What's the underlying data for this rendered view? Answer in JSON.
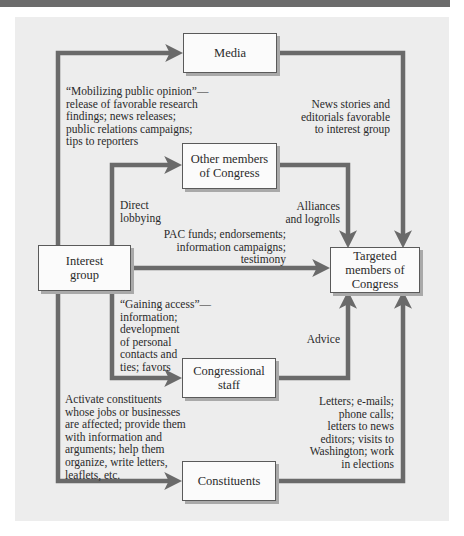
{
  "figure": {
    "banner_title": "",
    "nodes": {
      "media": "Media",
      "other_members": [
        "Other members",
        "of Congress"
      ],
      "interest_group": [
        "Interest",
        "group"
      ],
      "targeted": [
        "Targeted",
        "members of",
        "Congress"
      ],
      "staff": [
        "Congressional",
        "staff"
      ],
      "constituents": "Constituents"
    },
    "edges": {
      "mobilizing": [
        "“Mobilizing public opinion”—",
        "release of favorable research",
        "findings; news releases;",
        "public relations campaigns;",
        "tips to reporters"
      ],
      "news_stories": [
        "News stories and",
        "editorials favorable",
        "to interest group"
      ],
      "direct_lobbying": [
        "Direct",
        "lobbying"
      ],
      "alliances": [
        "Alliances",
        "and logrolls"
      ],
      "pac_funds": [
        "PAC funds; endorsements;",
        "information campaigns;",
        "testimony"
      ],
      "gaining_access": [
        "“Gaining access”—",
        "information;",
        "development",
        "of personal",
        "contacts and",
        "ties; favors"
      ],
      "advice": [
        "Advice"
      ],
      "activate": [
        "Activate constituents",
        "whose jobs or businesses",
        "are affected; provide them",
        "with information and",
        "arguments; help them",
        "organize, write letters,",
        "leaflets, etc."
      ],
      "letters": [
        "Letters; e-mails;",
        "phone calls;",
        "letters to news",
        "editors; visits to",
        "Washington; work",
        "in elections"
      ]
    },
    "colors": {
      "arrow": "#6a6a6a",
      "panel": "#ededed",
      "banner": "#6b6b6b",
      "box_border": "#5a5a5a"
    }
  }
}
